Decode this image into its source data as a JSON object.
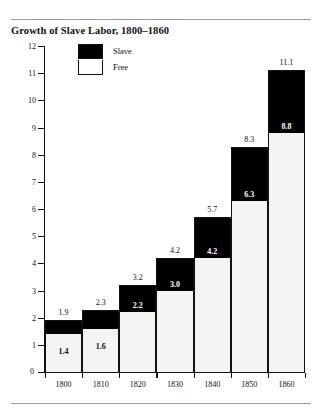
{
  "chart_data": {
    "type": "bar",
    "subtype": "stacked-bar",
    "title": "Growth of Slave Labor, 1800–1860",
    "xlabel": "",
    "ylabel": "In millions of persons ten years old and over",
    "categories": [
      "1800",
      "1810",
      "1820",
      "1830",
      "1840",
      "1850",
      "1860"
    ],
    "series": [
      {
        "name": "Free",
        "values": [
          1.4,
          1.6,
          2.2,
          3.0,
          4.2,
          6.3,
          8.8
        ]
      },
      {
        "name": "Slave",
        "values": [
          0.5,
          0.7,
          1.0,
          1.2,
          1.5,
          2.0,
          2.3
        ]
      }
    ],
    "totals": [
      1.9,
      2.3,
      3.2,
      4.2,
      5.7,
      8.3,
      11.1
    ],
    "total_labels": [
      "1.9",
      "2.3",
      "3.2",
      "4.2",
      "5.7",
      "8.3",
      "11.1"
    ],
    "free_labels": [
      "1.4",
      "1.6",
      "2.2",
      "3.0",
      "4.2",
      "6.3",
      "8.8"
    ],
    "ylim": [
      0,
      12
    ],
    "yticks": [
      "12",
      "11",
      "10",
      "9",
      "8",
      "7",
      "6",
      "5",
      "4",
      "3",
      "2",
      "1",
      "0"
    ],
    "ytick_values": [
      12,
      11,
      10,
      9,
      8,
      7,
      6,
      5,
      4,
      3,
      2,
      1,
      0
    ],
    "grid": false,
    "legend": {
      "position": "top-left-inside",
      "entries": [
        {
          "label": "Slave",
          "color": "#000000"
        },
        {
          "label": "Free",
          "color": "#ffffff"
        }
      ]
    },
    "colors": {
      "slave": "#000000",
      "free": "#f4f4f2",
      "axis": "#111111",
      "rule": "#9a9a9a",
      "background": "#ffffff"
    }
  }
}
